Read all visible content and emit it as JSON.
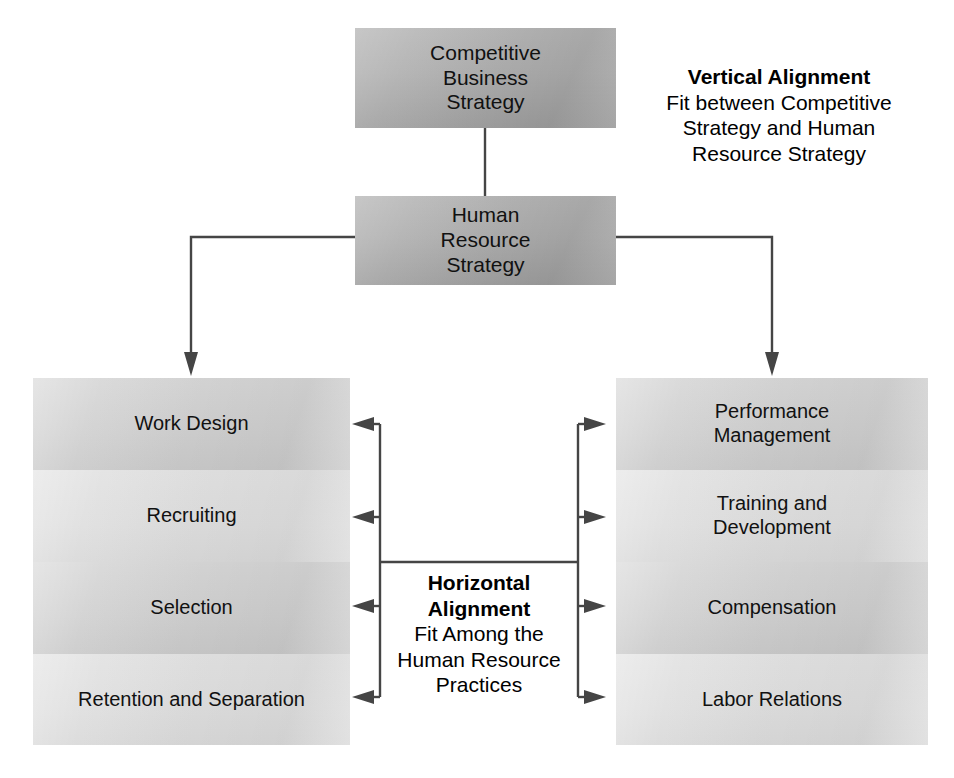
{
  "diagram": {
    "title_top": "Competitive Business Strategy",
    "nodes": {
      "competitive_business_strategy": "Competitive\nBusiness\nStrategy",
      "human_resource_strategy": "Human\nResource\nStrategy"
    },
    "top_box": {
      "line1": "Competitive",
      "line2": "Business",
      "line3": "Strategy"
    },
    "hr_box": {
      "line1": "Human",
      "line2": "Resource",
      "line3": "Strategy"
    },
    "vertical_callout": {
      "heading": "Vertical Alignment",
      "line1": "Fit between Competitive",
      "line2": "Strategy and Human",
      "line3": "Resource Strategy"
    },
    "horizontal_callout": {
      "heading_line1": "Horizontal",
      "heading_line2": "Alignment",
      "line1": "Fit Among the",
      "line2": "Human Resource",
      "line3": "Practices"
    },
    "left_column": [
      {
        "label": "Work Design",
        "shade": "dark"
      },
      {
        "label": "Recruiting",
        "shade": "light"
      },
      {
        "label": "Selection",
        "shade": "dark"
      },
      {
        "label": "Retention and Separation",
        "shade": "light"
      }
    ],
    "right_column": [
      {
        "label_line1": "Performance",
        "label_line2": "Management",
        "shade": "dark"
      },
      {
        "label_line1": "Training and",
        "label_line2": "Development",
        "shade": "light"
      },
      {
        "label_line1": "Compensation",
        "label_line2": "",
        "shade": "dark"
      },
      {
        "label_line1": "Labor Relations",
        "label_line2": "",
        "shade": "light"
      }
    ],
    "colors": {
      "strategy_box_fill": "#b2b2b2",
      "practice_box_dark": "#cfcfcf",
      "practice_box_light": "#dcdcdc",
      "connector_stroke": "#454545",
      "text": "#111111",
      "background": "#ffffff"
    }
  }
}
